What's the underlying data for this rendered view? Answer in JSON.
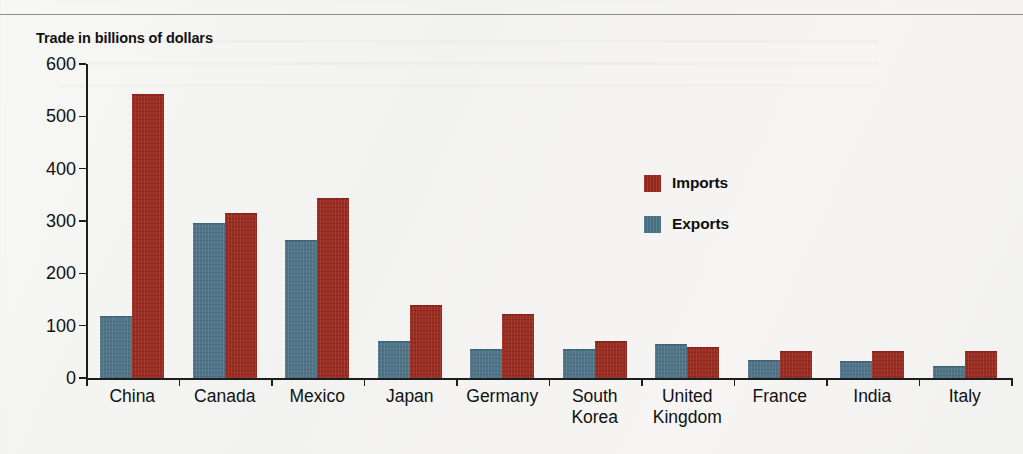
{
  "chart_data": {
    "type": "bar",
    "title": "Trade in billions of dollars",
    "xlabel": "",
    "ylabel": "",
    "ylim": [
      0,
      600
    ],
    "yticks": [
      0,
      100,
      200,
      300,
      400,
      500,
      600
    ],
    "grid": false,
    "legend_position": "center-right",
    "categories": [
      "China",
      "Canada",
      "Mexico",
      "Japan",
      "Germany",
      "South\nKorea",
      "United\nKingdom",
      "France",
      "India",
      "Italy"
    ],
    "series": [
      {
        "name": "Exports",
        "color": "#4e7489",
        "values": [
          117,
          295,
          262,
          68,
          53,
          53,
          63,
          33,
          31,
          21
        ]
      },
      {
        "name": "Imports",
        "color": "#9e2a1e",
        "values": [
          540,
          313,
          342,
          137,
          120,
          68,
          57,
          49,
          49,
          49
        ]
      }
    ]
  },
  "legend": {
    "items": [
      {
        "label": "Imports",
        "color": "#9e2a1e",
        "series_key": "imports"
      },
      {
        "label": "Exports",
        "color": "#4e7489",
        "series_key": "exports"
      }
    ]
  },
  "axis": {
    "y_tick_labels": [
      "600",
      "500",
      "400",
      "300",
      "200",
      "100",
      "0"
    ]
  }
}
